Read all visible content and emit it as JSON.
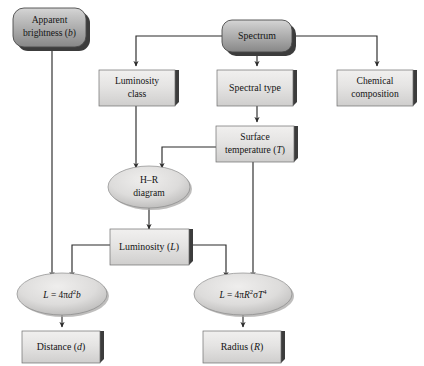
{
  "diagram": {
    "background_color": "#ffffff",
    "colors": {
      "dark_node_fill_top": "#c9c9c9",
      "dark_node_fill_bottom": "#8f8f8f",
      "light_node_fill_top": "#eceaea",
      "light_node_fill_bottom": "#d2d2d2",
      "ellipse_fill_top": "#e6e4e4",
      "ellipse_fill_bottom": "#bcbcbc",
      "shadow": "#3c3c3c",
      "connector": "#2a2a2a",
      "text": "#141414"
    },
    "nodes": [
      {
        "id": "apparent-brightness",
        "shape": "rounded-rect-dark",
        "line1": "Apparent",
        "line2_pre": "brightness (",
        "line2_var": "b",
        "line2_post": ")"
      },
      {
        "id": "spectrum",
        "shape": "rounded-rect-dark",
        "line1": "Spectrum"
      },
      {
        "id": "luminosity-class",
        "shape": "rect-light",
        "line1": "Luminosity",
        "line2": "class"
      },
      {
        "id": "spectral-type",
        "shape": "rect-light",
        "line1": "Spectral type"
      },
      {
        "id": "chemical-composition",
        "shape": "rect-light",
        "line1": "Chemical",
        "line2": "composition"
      },
      {
        "id": "surface-temperature",
        "shape": "rect-light",
        "line1": "Surface",
        "line2_pre": "temperature (",
        "line2_var": "T",
        "line2_post": ")"
      },
      {
        "id": "hr-diagram",
        "shape": "ellipse",
        "line1": "H–R",
        "line2": "diagram"
      },
      {
        "id": "luminosity",
        "shape": "rect-light",
        "line1_pre": "Luminosity (",
        "line1_var": "L",
        "line1_post": ")"
      },
      {
        "id": "formula-distance",
        "shape": "ellipse",
        "formula": "L = 4πd²b",
        "parts": {
          "lhs": "L",
          "eq": " = 4π",
          "var1": "d",
          "exp1": "2",
          "var2": "b"
        }
      },
      {
        "id": "formula-radius",
        "shape": "ellipse",
        "formula": "L = 4πR²σT⁴",
        "parts": {
          "lhs": "L",
          "eq": " = 4π",
          "var1": "R",
          "exp1": "2",
          "sigma": "σ",
          "var2": "T",
          "exp2": "4"
        }
      },
      {
        "id": "distance",
        "shape": "rect-light",
        "line1_pre": "Distance (",
        "line1_var": "d",
        "line1_post": ")"
      },
      {
        "id": "radius",
        "shape": "rect-light",
        "line1_pre": "Radius (",
        "line1_var": "R",
        "line1_post": ")"
      }
    ],
    "edges": [
      {
        "id": "spectrum-to-luminosity-class",
        "from": "spectrum",
        "to": "luminosity-class"
      },
      {
        "id": "spectrum-to-spectral-type",
        "from": "spectrum",
        "to": "spectral-type"
      },
      {
        "id": "spectrum-to-chemical-composition",
        "from": "spectrum",
        "to": "chemical-composition"
      },
      {
        "id": "spectral-type-to-surface-temperature",
        "from": "spectral-type",
        "to": "surface-temperature"
      },
      {
        "id": "luminosity-class-to-hr-diagram",
        "from": "luminosity-class",
        "to": "hr-diagram"
      },
      {
        "id": "surface-temperature-to-hr-diagram",
        "from": "surface-temperature",
        "to": "hr-diagram"
      },
      {
        "id": "hr-diagram-to-luminosity",
        "from": "hr-diagram",
        "to": "luminosity"
      },
      {
        "id": "luminosity-to-formula-distance",
        "from": "luminosity",
        "to": "formula-distance"
      },
      {
        "id": "luminosity-to-formula-radius",
        "from": "luminosity",
        "to": "formula-radius"
      },
      {
        "id": "apparent-brightness-to-formula-distance",
        "from": "apparent-brightness",
        "to": "formula-distance"
      },
      {
        "id": "surface-temperature-to-formula-radius",
        "from": "surface-temperature",
        "to": "formula-radius"
      },
      {
        "id": "formula-distance-to-distance",
        "from": "formula-distance",
        "to": "distance"
      },
      {
        "id": "formula-radius-to-radius",
        "from": "formula-radius",
        "to": "radius"
      }
    ]
  }
}
